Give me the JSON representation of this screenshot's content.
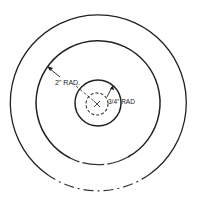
{
  "diagram": {
    "type": "concentric-circles",
    "center": [
      98,
      103
    ],
    "circles": [
      {
        "name": "outer-circle",
        "r": 88,
        "style": "solid-broken-bottom"
      },
      {
        "name": "middle-circle",
        "r": 62,
        "style": "solid-broken-bottom"
      },
      {
        "name": "inner-circle",
        "r": 23,
        "style": "solid"
      },
      {
        "name": "center-dashed-circle",
        "r": 11,
        "style": "dashed"
      }
    ],
    "labels": {
      "large_radius": "2\" RAD.",
      "small_radius": "3/4\" RAD"
    },
    "center_mark": "×"
  }
}
